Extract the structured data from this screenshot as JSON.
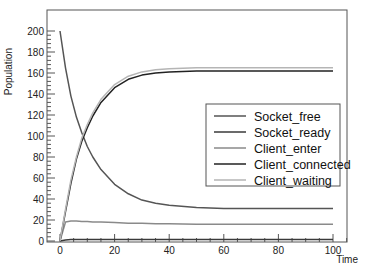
{
  "chart_data": {
    "type": "line",
    "title": "",
    "xlabel": "Time",
    "ylabel": "Population",
    "xlim": [
      -4,
      106
    ],
    "ylim": [
      0,
      210
    ],
    "xticks": [
      0,
      20,
      40,
      60,
      80,
      100
    ],
    "yticks": [
      0,
      20,
      40,
      60,
      80,
      100,
      120,
      140,
      160,
      180,
      200
    ],
    "grid": false,
    "legend_position": "center-right",
    "x": [
      0,
      2,
      4,
      6,
      8,
      10,
      12,
      15,
      20,
      25,
      30,
      35,
      40,
      50,
      60,
      70,
      80,
      90,
      100
    ],
    "series": [
      {
        "name": "Socket_free",
        "color": "#555555",
        "values": [
          200,
          165,
          138,
          118,
          103,
          90,
          80,
          68,
          54,
          45,
          39,
          36,
          34,
          32,
          31,
          31,
          31,
          31,
          31
        ]
      },
      {
        "name": "Socket_ready",
        "color": "#3a3a3a",
        "values": [
          0,
          1,
          1.5,
          1.5,
          1.5,
          1.5,
          1.5,
          1.5,
          1.5,
          1.5,
          1.5,
          1.5,
          1.5,
          1.5,
          1.5,
          1.5,
          1.5,
          1.5,
          1.5
        ]
      },
      {
        "name": "Client_enter",
        "color": "#8a8a8a",
        "values": [
          0,
          18,
          19,
          19,
          18.5,
          18.5,
          18,
          18,
          17.5,
          17,
          17,
          16.5,
          16.5,
          16,
          16,
          16,
          16,
          16,
          16
        ]
      },
      {
        "name": "Client_connected",
        "color": "#222222",
        "values": [
          0,
          28,
          55,
          78,
          95,
          108,
          119,
          132,
          146,
          154,
          158,
          160,
          161,
          162,
          162,
          162,
          162,
          162,
          162
        ]
      },
      {
        "name": "Client_waiting",
        "color": "#b5b5b5",
        "values": [
          0,
          30,
          58,
          80,
          98,
          111,
          122,
          135,
          149,
          157,
          161,
          163,
          164,
          165,
          165,
          165,
          165,
          165,
          165
        ]
      }
    ]
  },
  "plot": {
    "x_axis_label": "Time",
    "y_axis_label": "Population"
  },
  "legend": {
    "items": [
      {
        "label": "Socket_free"
      },
      {
        "label": "Socket_ready"
      },
      {
        "label": "Client_enter"
      },
      {
        "label": "Client_connected"
      },
      {
        "label": "Client_waiting"
      }
    ]
  }
}
